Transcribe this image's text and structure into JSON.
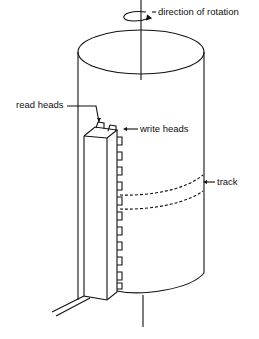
{
  "figure": {
    "labels": {
      "rotation": "direction of rotation",
      "read_heads": "read heads",
      "write_heads": "write heads",
      "track": "track"
    },
    "head_count": 11,
    "colors": {
      "stroke": "#111111",
      "background": "#ffffff"
    }
  }
}
